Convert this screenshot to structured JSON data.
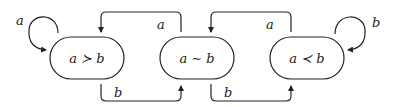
{
  "diagram": {
    "type": "state-machine",
    "states": [
      {
        "id": "gt",
        "label": "a ≻ b"
      },
      {
        "id": "eq",
        "label": "a ∼ b"
      },
      {
        "id": "lt",
        "label": "a ≺ b"
      }
    ],
    "transitions": [
      {
        "from": "gt",
        "to": "gt",
        "label": "a"
      },
      {
        "from": "gt",
        "to": "eq",
        "label": "b"
      },
      {
        "from": "eq",
        "to": "gt",
        "label": "a"
      },
      {
        "from": "eq",
        "to": "lt",
        "label": "b"
      },
      {
        "from": "lt",
        "to": "eq",
        "label": "a"
      },
      {
        "from": "lt",
        "to": "lt",
        "label": "b"
      }
    ],
    "stroke_color": "#222222"
  }
}
